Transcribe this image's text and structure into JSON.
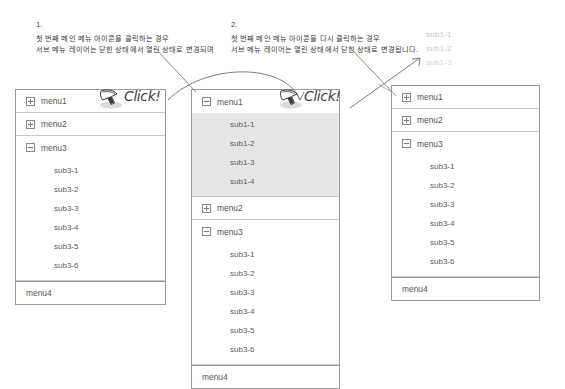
{
  "diagram": {
    "notes": [
      {
        "number": "1.",
        "line1": "첫 번째 메인 메뉴 아이콘을 클릭하는 경우",
        "line2": "서브 메뉴 레이어는 닫힌 상태에서 열린 상태로 변경되며"
      },
      {
        "number": "2.",
        "line1": "첫 번째 메인 메뉴 아이콘을 다시 클릭하는 경우",
        "line2": "서브 메뉴 레이어는 열린 상태에서 닫힌 상태로 변경됩니다."
      }
    ],
    "click_badges": [
      {
        "label": "Click!",
        "cursor_icon": "mouse-cursor-icon"
      },
      {
        "label": "Click!",
        "cursor_icon": "mouse-cursor-icon"
      }
    ],
    "ghost_items": [
      "sub1-1",
      "sub1-2",
      "sub1-3"
    ],
    "panels": [
      {
        "id": "panel-left",
        "caption": "state-before-click",
        "rows": [
          {
            "type": "main",
            "label": "menu1",
            "toggle": "plus",
            "icon": "expand-plus-icon"
          },
          {
            "type": "main",
            "label": "menu2",
            "toggle": "plus",
            "icon": "expand-plus-icon"
          },
          {
            "type": "main",
            "label": "menu3",
            "toggle": "minus",
            "icon": "collapse-minus-icon"
          },
          {
            "type": "subs",
            "highlight": false,
            "items": [
              "sub3-1",
              "sub3-2",
              "sub3-3",
              "sub3-4",
              "sub3-5",
              "sub3-6"
            ]
          },
          {
            "type": "main",
            "label": "menu4",
            "toggle": "none",
            "icon": "none"
          }
        ]
      },
      {
        "id": "panel-mid",
        "caption": "state-menu1-expanded",
        "rows": [
          {
            "type": "main",
            "label": "menu1",
            "toggle": "minus",
            "icon": "collapse-minus-icon"
          },
          {
            "type": "subs",
            "highlight": true,
            "items": [
              "sub1-1",
              "sub1-2",
              "sub1-3",
              "sub1-4"
            ]
          },
          {
            "type": "main",
            "label": "menu2",
            "toggle": "plus",
            "icon": "expand-plus-icon"
          },
          {
            "type": "main",
            "label": "menu3",
            "toggle": "minus",
            "icon": "collapse-minus-icon"
          },
          {
            "type": "subs",
            "highlight": false,
            "items": [
              "sub3-1",
              "sub3-2",
              "sub3-3",
              "sub3-4",
              "sub3-5",
              "sub3-6"
            ]
          },
          {
            "type": "main",
            "label": "menu4",
            "toggle": "none",
            "icon": "none"
          }
        ]
      },
      {
        "id": "panel-right",
        "caption": "state-after-second-click",
        "rows": [
          {
            "type": "main",
            "label": "menu1",
            "toggle": "plus",
            "icon": "expand-plus-icon"
          },
          {
            "type": "main",
            "label": "menu2",
            "toggle": "plus",
            "icon": "expand-plus-icon"
          },
          {
            "type": "main",
            "label": "menu3",
            "toggle": "minus",
            "icon": "collapse-minus-icon"
          },
          {
            "type": "subs",
            "highlight": false,
            "items": [
              "sub3-1",
              "sub3-2",
              "sub3-3",
              "sub3-4",
              "sub3-5",
              "sub3-6"
            ]
          },
          {
            "type": "main",
            "label": "menu4",
            "toggle": "none",
            "icon": "none"
          }
        ]
      }
    ],
    "colors": {
      "panel_border": "#9a9a9a",
      "row_divider": "#c8c8c8",
      "highlight_fill": "#e6e6e6",
      "text": "#555555",
      "ghost_text": "#c2c7d6",
      "annotation_line": "#6f6f6f"
    }
  }
}
